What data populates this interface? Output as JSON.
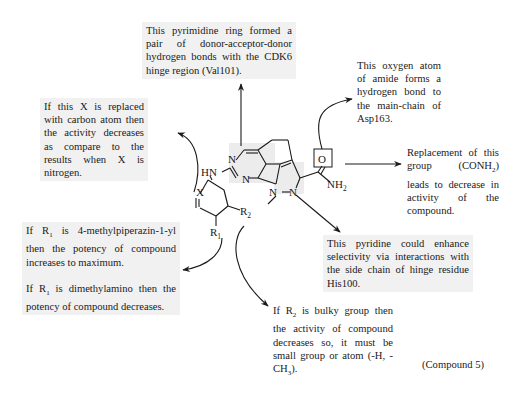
{
  "notes": {
    "pyrimidine": "This pyrimidine ring formed a pair of donor-acceptor-donor hydrogen bonds with the CDK6 hinge region (Val101).",
    "oxygen": "This oxygen atom of amide forms a hydrogen bond to the main-chain of Asp163.",
    "x_atom": "If this X is replaced with carbon atom then the activity decreases as compare to the results when X is nitrogen.",
    "conh2_pre": "Replacement of this group (CONH",
    "conh2_sub": "2",
    "conh2_post": ") leads to decrease in activity of the compound.",
    "pyridine": "This pyridine could enhance selectivity via interactions with the side chain of hinge residue His100.",
    "r1_a_pre": "If R",
    "r1_a_sub": "1",
    "r1_a_post": " is 4-methylpiperazin-1-yl then the potency of compound increases to maximum.",
    "r1_b_pre": "If R",
    "r1_b_sub": "1",
    "r1_b_post": " is dimethylamino then the potency of compound decreases.",
    "r2_pre": "If R",
    "r2_sub": "2",
    "r2_mid": " is bulky group then the activity of compound decreases so, it must be small group or atom (-H, -CH",
    "r2_sub2": "3",
    "r2_post": ")."
  },
  "molecule": {
    "atoms": {
      "n1": "N",
      "n2": "N",
      "hn": "HN",
      "n_pz1": "N",
      "n_pz2": "N",
      "o": "O",
      "nh2": "NH",
      "nh2_sub": "2",
      "x": "X",
      "r1": "R",
      "r1_sub": "1",
      "r2": "R",
      "r2_sub": "2"
    }
  },
  "caption": "(Compound 5)",
  "colors": {
    "text": "#1a1a1a",
    "shade": "#f1f1f1",
    "arrow": "#1a1a1a"
  }
}
